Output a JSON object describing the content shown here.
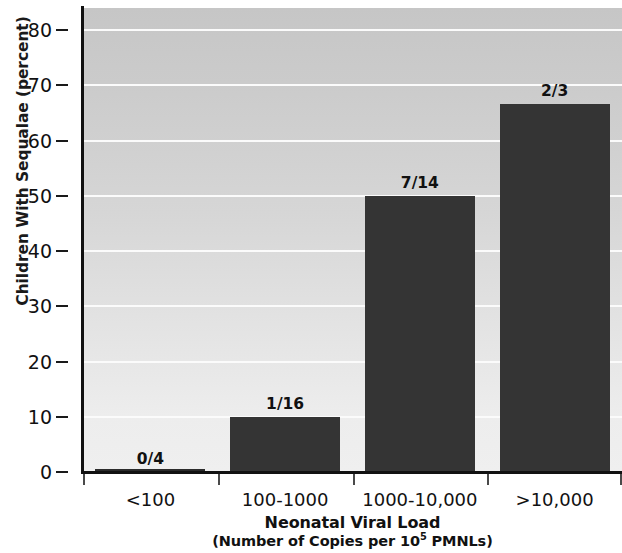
{
  "chart_data": {
    "type": "bar",
    "title": "",
    "xlabel": "Neonatal Viral Load",
    "xlabel_sub_prefix": "(Number of Copies per 10",
    "xlabel_sub_sup": "5",
    "xlabel_sub_suffix": " PMNLs)",
    "ylabel": "Children With Sequalae (percent)",
    "categories": [
      "<100",
      "100-1000",
      "1000-10,000",
      ">10,000"
    ],
    "values": [
      0,
      10,
      50,
      66.7
    ],
    "bar_labels": [
      "0/4",
      "1/16",
      "7/14",
      "2/3"
    ],
    "ylim": [
      0,
      84
    ],
    "yticks": [
      0,
      10,
      20,
      30,
      40,
      50,
      60,
      70,
      80
    ],
    "ytick_labels": [
      "0",
      "10",
      "20",
      "30",
      "40",
      "50",
      "60",
      "70",
      "80"
    ],
    "grid": true,
    "legend": "none",
    "colors": {
      "bar": "#343434",
      "plot_background_top": "#c6c6c6",
      "plot_background_bottom": "#efefef",
      "gridline": "#fbfbfb",
      "axis": "#111111",
      "text": "#111111"
    }
  }
}
